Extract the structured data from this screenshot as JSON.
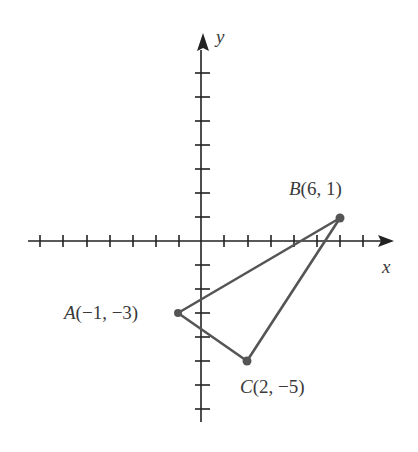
{
  "figure": {
    "axes": {
      "x_label": "x",
      "y_label": "y",
      "x_ticks_negative": 7,
      "x_ticks_positive": 7,
      "y_ticks_positive": 7,
      "y_ticks_negative": 7
    },
    "points": [
      {
        "name": "A",
        "x": -1,
        "y": -3,
        "coords": "(−1, −3)"
      },
      {
        "name": "B",
        "x": 6,
        "y": 1,
        "coords": "(6, 1)"
      },
      {
        "name": "C",
        "x": 2,
        "y": -5,
        "coords": "(2, −5)"
      }
    ],
    "shape": "triangle ABC",
    "colors": {
      "axis": "#222222",
      "triangle": "#555555",
      "point": "#555555",
      "label": "#3a3a3a"
    }
  }
}
